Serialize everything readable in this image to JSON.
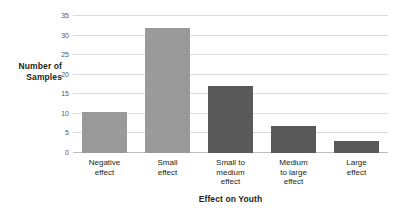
{
  "chart_data": {
    "type": "bar",
    "title": "",
    "xlabel": "Effect on Youth",
    "ylabel": "Number of Samples",
    "categories": [
      "Negative effect",
      "Small effect",
      "Small to medium effect",
      "Medium to large effect",
      "Large effect"
    ],
    "values": [
      10.5,
      32,
      17,
      7,
      3
    ],
    "bar_colors": [
      "#9a9a9a",
      "#9a9a9a",
      "#595959",
      "#595959",
      "#595959"
    ],
    "ylim": [
      0,
      35
    ],
    "yticks": [
      0,
      5,
      10,
      15,
      20,
      25,
      30,
      35
    ],
    "ytick_labels": [
      "0",
      "5",
      "10",
      "15",
      "20",
      "25",
      "30",
      "35"
    ],
    "grid": true,
    "grid_color": "#dcdcdc",
    "legend": null,
    "legend_position": "none"
  },
  "axis": {
    "y_title_line1": "Number of",
    "y_title_line2": "Samples",
    "x_title": "Effect on Youth"
  },
  "categories_wrapped": [
    [
      "Negative",
      "effect"
    ],
    [
      "Small",
      "effect"
    ],
    [
      "Small to",
      "medium",
      "effect"
    ],
    [
      "Medium",
      "to large",
      "effect"
    ],
    [
      "Large",
      "effect"
    ]
  ],
  "colors": {
    "light_bar": "#9a9a9a",
    "dark_bar": "#595959",
    "gridline": "#dcdcdc",
    "baseline": "#bdbdbd",
    "text": "#231f20",
    "tick_text": "#58595b",
    "background": "#ffffff"
  }
}
